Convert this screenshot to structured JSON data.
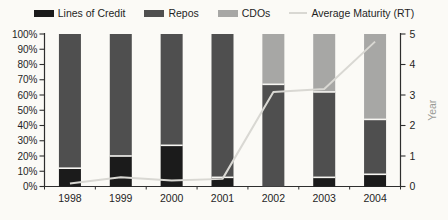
{
  "colors": {
    "background": "#fbfaf6",
    "axis": "#2e2e2e",
    "tick_text": "#1f1f1f",
    "year_label_text": "#9a9a96",
    "separator": "#f7f6f2"
  },
  "legend": {
    "items": [
      {
        "label": "Lines of Credit",
        "swatch": "bar",
        "color": "#1b1b1b"
      },
      {
        "label": "Repos",
        "swatch": "bar",
        "color": "#4f4f4f"
      },
      {
        "label": "CDOs",
        "swatch": "bar",
        "color": "#a7a7a5"
      },
      {
        "label": "Average Maturity (RT)",
        "swatch": "line",
        "color": "#d9d8d3"
      }
    ]
  },
  "chart_data": {
    "type": "bar",
    "subtype": "stacked-percent-with-line",
    "categories": [
      "1998",
      "1999",
      "2000",
      "2001",
      "2002",
      "2003",
      "2004"
    ],
    "series": [
      {
        "name": "Lines of Credit",
        "type": "bar",
        "color": "#1b1b1b",
        "values": [
          12,
          20,
          27,
          6,
          0,
          6,
          8
        ]
      },
      {
        "name": "Repos",
        "type": "bar",
        "color": "#4f4f4f",
        "values": [
          88,
          80,
          73,
          94,
          67,
          56,
          36
        ]
      },
      {
        "name": "CDOs",
        "type": "bar",
        "color": "#a7a7a5",
        "values": [
          0,
          0,
          0,
          0,
          33,
          38,
          56
        ]
      },
      {
        "name": "Average Maturity (RT)",
        "type": "line",
        "axis": "right",
        "color": "#d9d8d3",
        "values": [
          0.1,
          0.3,
          0.2,
          0.25,
          3.1,
          3.2,
          4.75
        ]
      }
    ],
    "left_axis": {
      "min": 0,
      "max": 100,
      "ticks": [
        "0%",
        "10%",
        "20%",
        "30%",
        "40%",
        "50%",
        "60%",
        "70%",
        "80%",
        "90%",
        "100%"
      ]
    },
    "right_axis": {
      "min": 0,
      "max": 5,
      "ticks": [
        "0",
        "1",
        "2",
        "3",
        "4",
        "5"
      ],
      "label": "Year"
    },
    "grid": false,
    "legend_position": "top",
    "layout": {
      "plot": {
        "left": 44.5,
        "right": 400.5,
        "top": 34,
        "bottom": 186.5
      },
      "bar_width": 22
    }
  }
}
